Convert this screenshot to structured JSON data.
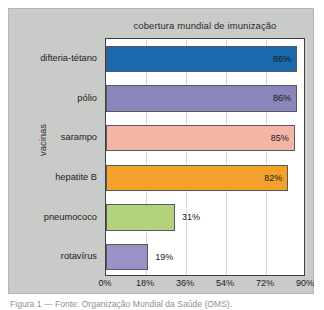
{
  "chart_data": {
    "type": "bar",
    "orientation": "horizontal",
    "title": "cobertura mundial de imunização",
    "xlabel": "",
    "ylabel": "vacinas",
    "categories": [
      "difteria-tétano",
      "pólio",
      "sarampo",
      "hepatite B",
      "pneumococo",
      "rotavírus"
    ],
    "values": [
      86,
      86,
      85,
      82,
      31,
      19
    ],
    "value_labels": [
      "86%",
      "86%",
      "85%",
      "82%",
      "31%",
      "19%"
    ],
    "colors": [
      "#1b69ad",
      "#8a85bb",
      "#f2b5a6",
      "#f3a12a",
      "#b3d27e",
      "#9a92c6"
    ],
    "xlim": [
      0,
      90
    ],
    "xticks": [
      0,
      18,
      36,
      54,
      72,
      90
    ],
    "xtick_labels": [
      "0%",
      "18%",
      "36%",
      "54%",
      "72%",
      "90%"
    ],
    "grid": true,
    "legend": false
  },
  "figure": {
    "panel_background": "#c9cbc8",
    "plot_background": "#ffffff",
    "axis_color": "#3c4046",
    "caption": "Figura 1 — Fonte: Organização Mundial da Saúde (OMS)."
  }
}
